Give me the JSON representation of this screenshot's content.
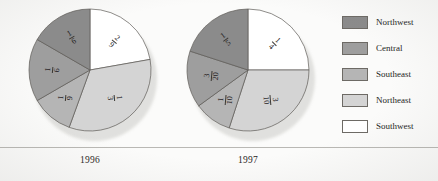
{
  "figure": {
    "baseline_rule_color": "#b9b8b4",
    "page_background": "#fbfbfa"
  },
  "legend": {
    "position": "right",
    "items": [
      {
        "label": "Northwest",
        "color": "#8b8b8b"
      },
      {
        "label": "Central",
        "color": "#9e9e9e"
      },
      {
        "label": "Southeast",
        "color": "#b5b5b5"
      },
      {
        "label": "Northeast",
        "color": "#d4d4d4"
      },
      {
        "label": "Southwest",
        "color": "#ffffff"
      }
    ]
  },
  "chart_data": [
    {
      "type": "pie",
      "title": "1996",
      "categories": [
        "Southwest",
        "Northeast",
        "Southeast",
        "Central",
        "Northwest"
      ],
      "values": [
        0.2222,
        0.3333,
        0.1111,
        0.1667,
        0.1667
      ],
      "labels": [
        "2/9",
        "1/3",
        "1/9",
        "1/6",
        "1/6"
      ],
      "label_numerators": [
        "2",
        "1",
        "1",
        "1",
        "1"
      ],
      "label_denominators": [
        "9",
        "3",
        "9",
        "6",
        "6"
      ],
      "colors": [
        "#ffffff",
        "#d4d4d4",
        "#b5b5b5",
        "#9e9e9e",
        "#8b8b8b"
      ],
      "start_angle_deg": 0,
      "legend": [
        "Northwest",
        "Central",
        "Southeast",
        "Northeast",
        "Southwest"
      ]
    },
    {
      "type": "pie",
      "title": "1997",
      "categories": [
        "Southwest",
        "Northeast",
        "Southeast",
        "Central",
        "Northwest"
      ],
      "values": [
        0.25,
        0.3,
        0.1,
        0.15,
        0.2
      ],
      "labels": [
        "1/4",
        "3/10",
        "1/10",
        "3/20",
        "1/5"
      ],
      "label_numerators": [
        "1",
        "3",
        "1",
        "3",
        "1"
      ],
      "label_denominators": [
        "4",
        "10",
        "10",
        "20",
        "5"
      ],
      "colors": [
        "#ffffff",
        "#d4d4d4",
        "#b5b5b5",
        "#9e9e9e",
        "#8b8b8b"
      ],
      "start_angle_deg": 0,
      "legend": [
        "Northwest",
        "Central",
        "Southeast",
        "Northeast",
        "Southwest"
      ]
    }
  ]
}
